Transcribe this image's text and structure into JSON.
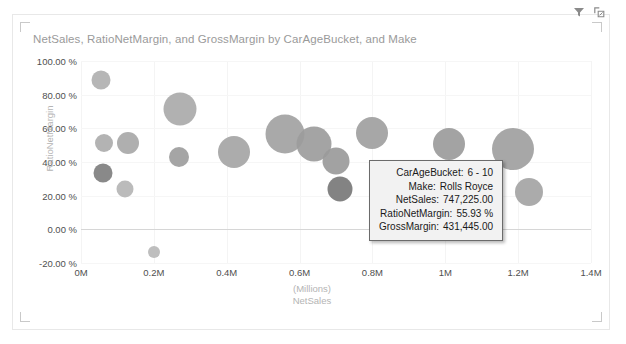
{
  "visual": {
    "title": "NetSales, RatioNetMargin, and GrossMargin by CarAgeBucket, and Make",
    "filter_icon": "filter-icon",
    "focus_icon": "focus-mode-icon"
  },
  "tooltip": {
    "rows": [
      {
        "label": "CarAgeBucket:",
        "value": "6 - 10"
      },
      {
        "label": "Make:",
        "value": "Rolls Royce"
      },
      {
        "label": "NetSales:",
        "value": "747,225.00"
      },
      {
        "label": "RatioNetMargin:",
        "value": "55.93 %"
      },
      {
        "label": "GrossMargin:",
        "value": "431,445.00"
      }
    ]
  },
  "chart_data": {
    "type": "scatter",
    "title": "NetSales, RatioNetMargin, and GrossMargin by CarAgeBucket, and Make",
    "xlabel": "NetSales",
    "xlabel_unit": "(Millions)",
    "ylabel": "RatioNetMargin",
    "grid": true,
    "legend": "none",
    "size_field": "GrossMargin",
    "xlim": [
      0,
      1400000
    ],
    "ylim": [
      -0.2,
      1.0
    ],
    "xticks": [
      "0M",
      "0.2M",
      "0.4M",
      "0.6M",
      "0.8M",
      "1M",
      "1.2M",
      "1.4M"
    ],
    "xtick_values": [
      0,
      200000,
      400000,
      600000,
      800000,
      1000000,
      1200000,
      1400000
    ],
    "yticks": [
      "100.00 %",
      "80.00 %",
      "60.00 %",
      "40.00 %",
      "20.00 %",
      "0.00 %",
      "-20.00 %"
    ],
    "ytick_values": [
      1.0,
      0.8,
      0.6,
      0.4,
      0.2,
      0.0,
      -0.2
    ],
    "points": [
      {
        "x": 55000,
        "y": 0.885,
        "r": 9.5,
        "color": "#b0b0b0"
      },
      {
        "x": 62000,
        "y": 0.515,
        "r": 9.0,
        "color": "#adadad"
      },
      {
        "x": 60000,
        "y": 0.335,
        "r": 9.5,
        "color": "#7f7f7f"
      },
      {
        "x": 128000,
        "y": 0.515,
        "r": 11.0,
        "color": "#a8a8a8"
      },
      {
        "x": 120000,
        "y": 0.238,
        "r": 8.5,
        "color": "#b5b5b5"
      },
      {
        "x": 200000,
        "y": -0.135,
        "r": 6.0,
        "color": "#b8b8b8"
      },
      {
        "x": 272000,
        "y": 0.715,
        "r": 16.5,
        "color": "#aaaaaa"
      },
      {
        "x": 268000,
        "y": 0.43,
        "r": 10.0,
        "color": "#9d9d9d"
      },
      {
        "x": 420000,
        "y": 0.46,
        "r": 16.0,
        "color": "#a5a5a5"
      },
      {
        "x": 560000,
        "y": 0.565,
        "r": 19.5,
        "color": "#a2a2a2"
      },
      {
        "x": 640000,
        "y": 0.505,
        "r": 17.5,
        "color": "#9c9c9c"
      },
      {
        "x": 700000,
        "y": 0.405,
        "r": 13.5,
        "color": "#9a9a9a"
      },
      {
        "x": 712000,
        "y": 0.238,
        "r": 12.5,
        "color": "#787878"
      },
      {
        "x": 800000,
        "y": 0.575,
        "r": 16.0,
        "color": "#a0a0a0"
      },
      {
        "x": 1010000,
        "y": 0.505,
        "r": 16.0,
        "color": "#9b9b9b"
      },
      {
        "x": 1185000,
        "y": 0.475,
        "r": 21.0,
        "color": "#a0a0a0"
      },
      {
        "x": 1230000,
        "y": 0.22,
        "r": 14.0,
        "color": "#a4a4a4"
      }
    ]
  }
}
